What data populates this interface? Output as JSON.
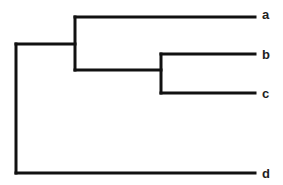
{
  "diagram": {
    "type": "dendrogram",
    "orientation": "left-to-right",
    "line_color": "#111111",
    "leaves": [
      {
        "label": "a",
        "y": 17
      },
      {
        "label": "b",
        "y": 54
      },
      {
        "label": "c",
        "y": 93
      },
      {
        "label": "d",
        "y": 173
      }
    ],
    "tree": "((a,(b,c)),d)",
    "nodes": {
      "root": {
        "x": 16,
        "children": [
          "abc",
          "d"
        ]
      },
      "abc": {
        "x": 75,
        "children": [
          "a",
          "bc"
        ]
      },
      "bc": {
        "x": 161,
        "children": [
          "b",
          "c"
        ]
      }
    },
    "leaf_x_end": 255
  }
}
